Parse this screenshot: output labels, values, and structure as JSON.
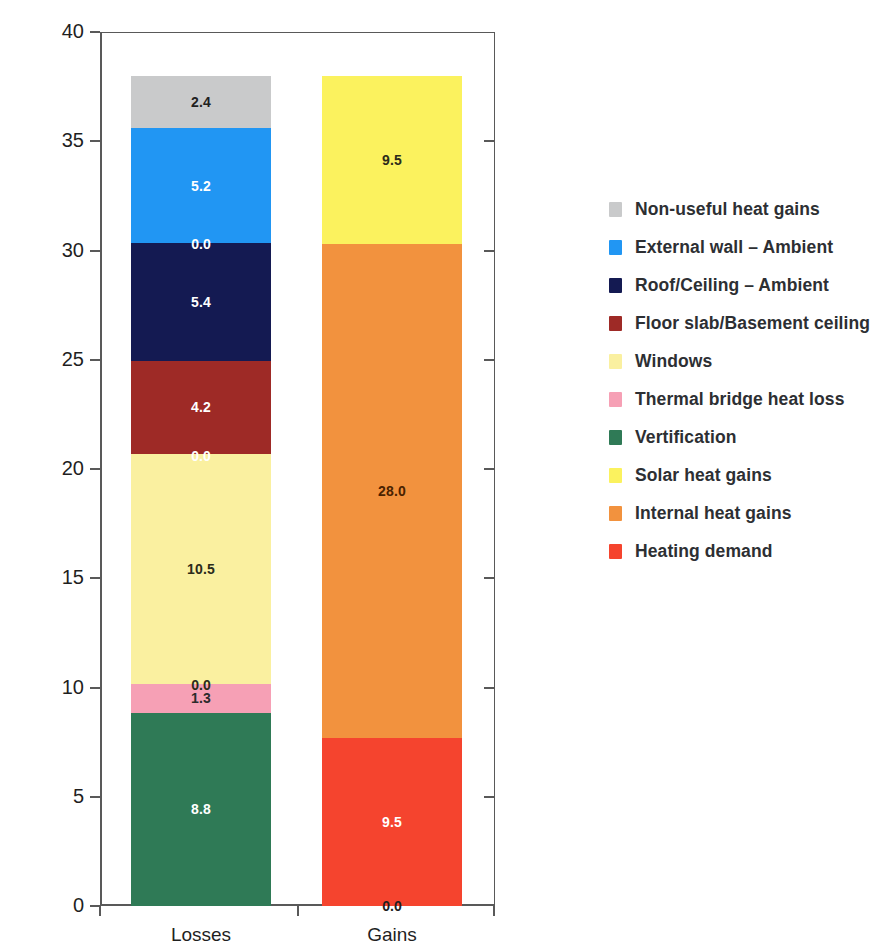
{
  "title_remnant": "",
  "chart_data": {
    "type": "bar",
    "subtype": "stacked-bar",
    "title": "",
    "xlabel": "",
    "ylabel": "Heat flows [kWh/(m²a)]",
    "ylabel_parts": {
      "main": "Heat flows [kWh/(m",
      "sup": "2",
      "tail": "a)]"
    },
    "ylim": [
      0,
      40
    ],
    "yticks": [
      0,
      5,
      10,
      15,
      20,
      25,
      30,
      35,
      40
    ],
    "ytick_labels": [
      "0",
      "5",
      "10",
      "15",
      "20",
      "25",
      "30",
      "35",
      "40"
    ],
    "grid": false,
    "legend_position": "right",
    "categories": [
      "Losses",
      "Gains"
    ],
    "totals": [
      38.0,
      38.0
    ],
    "series": [
      {
        "name": "Non-useful heat gains",
        "color": "#c9cacb",
        "values": [
          2.4,
          null
        ],
        "labels": [
          "2.4",
          ""
        ],
        "label_color": "#1f1f1f"
      },
      {
        "name": "External wall – Ambient",
        "color": "#2196f3",
        "values": [
          5.2,
          null
        ],
        "labels": [
          "5.2",
          ""
        ],
        "label_color": "#ffffff"
      },
      {
        "name": "Roof/Ceiling – Ambient",
        "color": "#141a52",
        "values": [
          5.4,
          null
        ],
        "labels": [
          "5.4",
          ""
        ],
        "label_color": "#ffffff"
      },
      {
        "name": "Floor slab/Basement ceiling",
        "color": "#9e2a26",
        "values": [
          4.2,
          null
        ],
        "labels": [
          "4.2",
          ""
        ],
        "label_color": "#ffffff"
      },
      {
        "name": "Windows",
        "color": "#faf0a0",
        "values": [
          10.5,
          null
        ],
        "labels": [
          "10.5",
          ""
        ],
        "label_color": "#2b2b1a"
      },
      {
        "name": "Thermal bridge heat loss",
        "color": "#f6a0b5",
        "values": [
          1.3,
          null
        ],
        "labels": [
          "1.3",
          ""
        ],
        "label_color": "#2b2b2b"
      },
      {
        "name": "Vertification",
        "color": "#2f7a56",
        "values": [
          8.8,
          null
        ],
        "labels": [
          "8.8",
          ""
        ],
        "label_color": "#ffffff"
      },
      {
        "name": "Solar heat gains",
        "color": "#fbf25e",
        "values": [
          null,
          9.5
        ],
        "labels": [
          "",
          "9.5"
        ],
        "label_color": "#2b2b1a"
      },
      {
        "name": "Internal heat gains",
        "color": "#f2923e",
        "values": [
          null,
          28.0
        ],
        "labels": [
          "",
          "28.0"
        ],
        "label_color": "#4a2200"
      },
      {
        "name": "Heating demand",
        "color": "#f5442e",
        "values": [
          null,
          9.5
        ],
        "labels": [
          "",
          "9.5"
        ],
        "label_color": "#ffffff"
      }
    ],
    "zero_annotations": [
      {
        "bar": "Losses",
        "value": "0.0",
        "at": 30.3,
        "color": "#ffffff"
      },
      {
        "bar": "Losses",
        "value": "0.0",
        "at": 20.6,
        "color": "#ffffff"
      },
      {
        "bar": "Losses",
        "value": "0.0",
        "at": 10.1,
        "color": "#2b2b1a"
      },
      {
        "bar": "Gains",
        "value": "0.0",
        "at": 0.0,
        "color": "#1f1f1f"
      }
    ]
  },
  "legend": {
    "items": [
      {
        "label": "Non-useful heat gains",
        "color": "#c9cacb"
      },
      {
        "label": "External wall – Ambient",
        "color": "#2196f3"
      },
      {
        "label": "Roof/Ceiling – Ambient",
        "color": "#141a52"
      },
      {
        "label": "Floor slab/Basement ceiling",
        "color": "#9e2a26"
      },
      {
        "label": "Windows",
        "color": "#faf0a0"
      },
      {
        "label": "Thermal bridge heat loss",
        "color": "#f6a0b5"
      },
      {
        "label": "Vertification",
        "color": "#2f7a56"
      },
      {
        "label": "Solar heat gains",
        "color": "#fbf25e"
      },
      {
        "label": "Internal heat gains",
        "color": "#f2923e"
      },
      {
        "label": "Heating demand",
        "color": "#f5442e"
      }
    ]
  },
  "axis": {
    "x_categories": [
      "Losses",
      "Gains"
    ]
  },
  "geometry": {
    "plot_left": 100,
    "plot_top": 32,
    "plot_width": 395,
    "plot_height": 874,
    "y_min": 0,
    "y_max": 40
  }
}
